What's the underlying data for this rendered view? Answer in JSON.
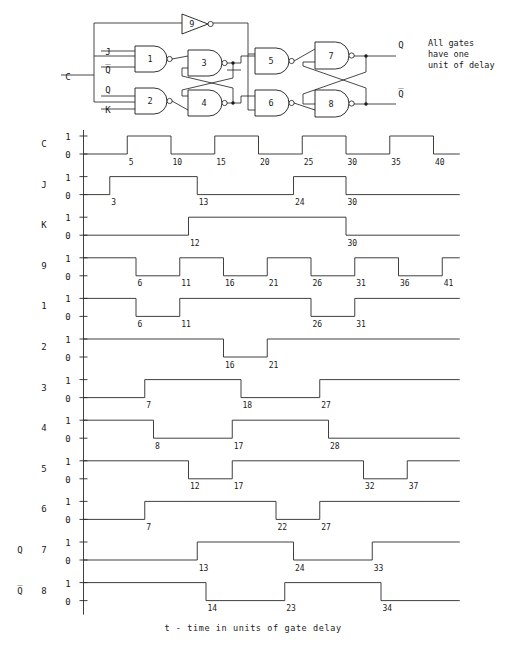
{
  "figure": {
    "title_note_lines": [
      "All gates",
      "have one",
      "unit of delay"
    ],
    "axis_caption": "t - time in units of gate delay",
    "time_scale": {
      "t0_x": 83.5,
      "px_per_unit": 8.75,
      "t_end": 43
    },
    "clock_ticks": [
      5,
      10,
      15,
      20,
      25,
      30,
      35,
      40
    ],
    "level_labels": {
      "high": "1",
      "low": "0"
    }
  },
  "circuit": {
    "inputs": [
      {
        "name": "C",
        "label": "C"
      },
      {
        "name": "J",
        "label": "J"
      },
      {
        "name": "Qb",
        "label": "Q̅"
      },
      {
        "name": "Q",
        "label": "Q"
      },
      {
        "name": "K",
        "label": "K"
      }
    ],
    "outputs": [
      {
        "name": "Q",
        "label": "Q"
      },
      {
        "name": "Qb",
        "label": "Q̅"
      }
    ],
    "gates": [
      {
        "id": "1",
        "label": "1",
        "type": "nand"
      },
      {
        "id": "2",
        "label": "2",
        "type": "nand"
      },
      {
        "id": "3",
        "label": "3",
        "type": "nand"
      },
      {
        "id": "4",
        "label": "4",
        "type": "nand"
      },
      {
        "id": "5",
        "label": "5",
        "type": "nand"
      },
      {
        "id": "6",
        "label": "6",
        "type": "nand"
      },
      {
        "id": "7",
        "label": "7",
        "type": "nand"
      },
      {
        "id": "8",
        "label": "8",
        "type": "nand"
      },
      {
        "id": "9",
        "label": "9",
        "type": "inverter"
      }
    ]
  },
  "chart_data": {
    "type": "line",
    "xlabel": "t - time in units of gate delay",
    "ylabel": "",
    "xlim": [
      0,
      43
    ],
    "ylim": [
      0,
      1
    ],
    "grid": false,
    "legend": "none",
    "x_ticks": [
      5,
      10,
      15,
      20,
      25,
      30,
      35,
      40
    ],
    "series": [
      {
        "name": "C",
        "row_label": "C",
        "side_label": "",
        "initial": 0,
        "transitions": [
          5,
          10,
          15,
          20,
          25,
          30,
          35,
          40
        ],
        "tick_labels": [
          5,
          10,
          15,
          20,
          25,
          30,
          35,
          40
        ],
        "show_axis_ticks": true
      },
      {
        "name": "J",
        "row_label": "J",
        "side_label": "",
        "initial": 0,
        "transitions": [
          3,
          13,
          24,
          30
        ],
        "tick_labels": [
          3,
          13,
          24,
          30
        ],
        "show_axis_ticks": false
      },
      {
        "name": "K",
        "row_label": "K",
        "side_label": "",
        "initial": 0,
        "transitions": [
          12,
          30
        ],
        "tick_labels": [
          12,
          30
        ],
        "show_axis_ticks": false
      },
      {
        "name": "9",
        "row_label": "9",
        "side_label": "",
        "initial": 1,
        "transitions": [
          6,
          11,
          16,
          21,
          26,
          31,
          36,
          41
        ],
        "tick_labels": [
          6,
          11,
          16,
          21,
          26,
          31,
          36,
          41
        ],
        "show_axis_ticks": false
      },
      {
        "name": "1",
        "row_label": "1",
        "side_label": "",
        "initial": 1,
        "transitions": [
          6,
          11,
          26,
          31
        ],
        "tick_labels": [
          6,
          11,
          26,
          31
        ],
        "show_axis_ticks": false
      },
      {
        "name": "2",
        "row_label": "2",
        "side_label": "",
        "initial": 1,
        "transitions": [
          16,
          21
        ],
        "tick_labels": [
          16,
          21
        ],
        "show_axis_ticks": false
      },
      {
        "name": "3",
        "row_label": "3",
        "side_label": "",
        "initial": 0,
        "transitions": [
          7,
          18,
          27
        ],
        "tick_labels": [
          7,
          18,
          27
        ],
        "show_axis_ticks": false
      },
      {
        "name": "4",
        "row_label": "4",
        "side_label": "",
        "initial": 1,
        "transitions": [
          8,
          17,
          28
        ],
        "tick_labels": [
          8,
          17,
          28
        ],
        "show_axis_ticks": false
      },
      {
        "name": "5",
        "row_label": "5",
        "side_label": "",
        "initial": 1,
        "transitions": [
          12,
          17,
          32,
          37
        ],
        "tick_labels": [
          12,
          17,
          32,
          37
        ],
        "show_axis_ticks": false
      },
      {
        "name": "6",
        "row_label": "6",
        "side_label": "",
        "initial": 0,
        "transitions": [
          7,
          22,
          27
        ],
        "tick_labels": [
          7,
          22,
          27
        ],
        "show_axis_ticks": false
      },
      {
        "name": "7",
        "row_label": "7",
        "side_label": "Q",
        "initial": 0,
        "transitions": [
          13,
          24,
          33
        ],
        "tick_labels": [
          13,
          24,
          33
        ],
        "show_axis_ticks": false
      },
      {
        "name": "8",
        "row_label": "8",
        "side_label": "Q̅",
        "initial": 1,
        "transitions": [
          14,
          23,
          34
        ],
        "tick_labels": [
          14,
          23,
          34
        ],
        "show_axis_ticks": false
      }
    ]
  }
}
